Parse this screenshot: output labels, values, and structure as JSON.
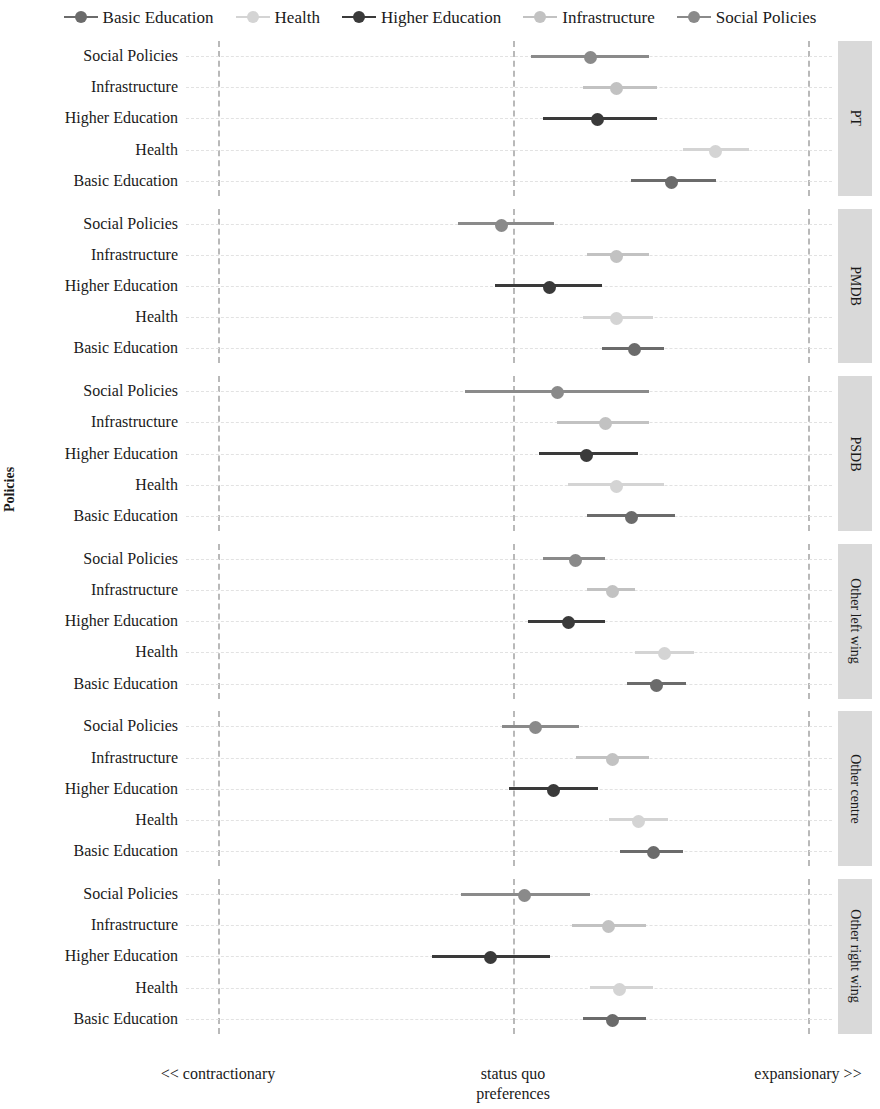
{
  "chart_data": {
    "type": "scatter",
    "title": "",
    "xlabel": "preferences",
    "ylabel": "Policies",
    "xlim": [
      0,
      10
    ],
    "grid": true,
    "legend_position": "top",
    "axis_tick_labels": [
      "<< contractionary",
      "status quo",
      "expansionary >>"
    ],
    "axis_tick_positions": [
      1,
      5,
      9
    ],
    "axis_sub_label": "preferences",
    "series": [
      {
        "name": "Basic Education",
        "color": "#6b6b6b"
      },
      {
        "name": "Health",
        "color": "#d4d4d4"
      },
      {
        "name": "Higher Education",
        "color": "#3a3a3a"
      },
      {
        "name": "Infrastructure",
        "color": "#c2c2c2"
      },
      {
        "name": "Social Policies",
        "color": "#8a8a8a"
      }
    ],
    "policy_order": [
      "Social Policies",
      "Infrastructure",
      "Higher Education",
      "Health",
      "Basic Education"
    ],
    "panels": [
      {
        "name": "PT",
        "rows": [
          {
            "policy": "Social Policies",
            "estimate": 6.05,
            "low": 5.25,
            "high": 6.85
          },
          {
            "policy": "Infrastructure",
            "estimate": 6.4,
            "low": 5.95,
            "high": 6.95
          },
          {
            "policy": "Higher Education",
            "estimate": 6.15,
            "low": 5.4,
            "high": 6.95
          },
          {
            "policy": "Health",
            "estimate": 7.75,
            "low": 7.3,
            "high": 8.2
          },
          {
            "policy": "Basic Education",
            "estimate": 7.15,
            "low": 6.6,
            "high": 7.75
          }
        ]
      },
      {
        "name": "PMDB",
        "rows": [
          {
            "policy": "Social Policies",
            "estimate": 4.85,
            "low": 4.25,
            "high": 5.55
          },
          {
            "policy": "Infrastructure",
            "estimate": 6.4,
            "low": 6.0,
            "high": 6.85
          },
          {
            "policy": "Higher Education",
            "estimate": 5.5,
            "low": 4.75,
            "high": 6.2
          },
          {
            "policy": "Health",
            "estimate": 6.4,
            "low": 5.95,
            "high": 6.9
          },
          {
            "policy": "Basic Education",
            "estimate": 6.65,
            "low": 6.2,
            "high": 7.05
          }
        ]
      },
      {
        "name": "PSDB",
        "rows": [
          {
            "policy": "Social Policies",
            "estimate": 5.6,
            "low": 4.35,
            "high": 6.85
          },
          {
            "policy": "Infrastructure",
            "estimate": 6.25,
            "low": 5.6,
            "high": 6.85
          },
          {
            "policy": "Higher Education",
            "estimate": 6.0,
            "low": 5.35,
            "high": 6.7
          },
          {
            "policy": "Health",
            "estimate": 6.4,
            "low": 5.75,
            "high": 7.05
          },
          {
            "policy": "Basic Education",
            "estimate": 6.6,
            "low": 6.0,
            "high": 7.2
          }
        ]
      },
      {
        "name": "Other left wing",
        "rows": [
          {
            "policy": "Social Policies",
            "estimate": 5.85,
            "low": 5.4,
            "high": 6.25
          },
          {
            "policy": "Infrastructure",
            "estimate": 6.35,
            "low": 6.0,
            "high": 6.65
          },
          {
            "policy": "Higher Education",
            "estimate": 5.75,
            "low": 5.2,
            "high": 6.25
          },
          {
            "policy": "Health",
            "estimate": 7.05,
            "low": 6.65,
            "high": 7.45
          },
          {
            "policy": "Basic Education",
            "estimate": 6.95,
            "low": 6.55,
            "high": 7.35
          }
        ]
      },
      {
        "name": "Other centre",
        "rows": [
          {
            "policy": "Social Policies",
            "estimate": 5.3,
            "low": 4.85,
            "high": 5.9
          },
          {
            "policy": "Infrastructure",
            "estimate": 6.35,
            "low": 5.85,
            "high": 6.85
          },
          {
            "policy": "Higher Education",
            "estimate": 5.55,
            "low": 4.95,
            "high": 6.15
          },
          {
            "policy": "Health",
            "estimate": 6.7,
            "low": 6.3,
            "high": 7.1
          },
          {
            "policy": "Basic Education",
            "estimate": 6.9,
            "low": 6.45,
            "high": 7.3
          }
        ]
      },
      {
        "name": "Other right wing",
        "rows": [
          {
            "policy": "Social Policies",
            "estimate": 5.15,
            "low": 4.3,
            "high": 6.05
          },
          {
            "policy": "Infrastructure",
            "estimate": 6.3,
            "low": 5.8,
            "high": 6.8
          },
          {
            "policy": "Higher Education",
            "estimate": 4.7,
            "low": 3.9,
            "high": 5.5
          },
          {
            "policy": "Health",
            "estimate": 6.45,
            "low": 6.05,
            "high": 6.9
          },
          {
            "policy": "Basic Education",
            "estimate": 6.35,
            "low": 5.95,
            "high": 6.8
          }
        ]
      }
    ]
  },
  "legend": {
    "items": [
      {
        "label": "Basic Education",
        "color": "#6b6b6b"
      },
      {
        "label": "Health",
        "color": "#d4d4d4"
      },
      {
        "label": "Higher Education",
        "color": "#3a3a3a"
      },
      {
        "label": "Infrastructure",
        "color": "#c2c2c2"
      },
      {
        "label": "Social Policies",
        "color": "#8a8a8a"
      }
    ]
  },
  "axes": {
    "y_title": "Policies",
    "x_left": "<< contractionary",
    "x_mid": "status quo",
    "x_mid2": "preferences",
    "x_right": "expansionary >>"
  }
}
